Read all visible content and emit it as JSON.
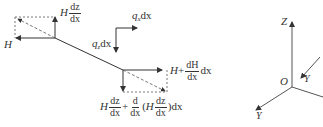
{
  "diagram": {
    "type": "cable-element-force-diagram",
    "labels": {
      "H_left": "H",
      "H_dz_H": "H",
      "H_dz_num": "dz",
      "H_dz_den": "dx",
      "qx_q": "q",
      "qx_sub": "x",
      "qx_dx": "dx",
      "qz_q": "q",
      "qz_sub": "z",
      "qz_dx": "dx",
      "right_H": "H",
      "right_plus": "+",
      "right_num": "dH",
      "right_den": "dx",
      "right_dx": "dx",
      "bottom_H": "H",
      "bottom_f1_num": "dz",
      "bottom_f1_den": "dx",
      "bottom_plus": "+",
      "bottom_f2_num": "d",
      "bottom_f2_den": "dx",
      "bottom_open": "(",
      "bottom_H2": "H",
      "bottom_f3_num": "dz",
      "bottom_f3_den": "dx",
      "bottom_close": ")dx"
    },
    "axes": {
      "z_label": "Z",
      "origin_label": "O",
      "y_upper_label": "Y",
      "y_lower_label": "Y"
    },
    "colors": {
      "line": "#333333",
      "axis": "#555555"
    }
  }
}
